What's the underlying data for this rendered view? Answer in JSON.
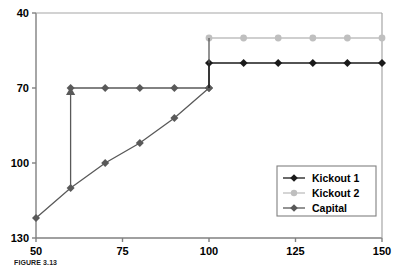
{
  "chart_data": {
    "type": "line",
    "title": "",
    "xlabel": "",
    "ylabel": "",
    "xlim": [
      50,
      150
    ],
    "ylim": [
      40,
      130
    ],
    "xticks": [
      50,
      75,
      100,
      125,
      150
    ],
    "yticks": [
      40,
      70,
      100,
      130
    ],
    "grid": false,
    "legend_position": "bottom-right",
    "series": [
      {
        "name": "Kickout 1",
        "color": "#1a1a1a",
        "marker": "diamond",
        "x": [
          100,
          110,
          120,
          130,
          140,
          150
        ],
        "values": [
          110,
          110,
          110,
          110,
          110,
          110
        ]
      },
      {
        "name": "Kickout 2",
        "color": "#bfbfbf",
        "marker": "circle",
        "x": [
          100,
          110,
          120,
          130,
          140,
          150
        ],
        "values": [
          120,
          120,
          120,
          120,
          120,
          120
        ]
      },
      {
        "name": "Capital",
        "color": "#595959",
        "marker": "diamond",
        "x": [
          50,
          60,
          70,
          80,
          90,
          100
        ],
        "values": [
          48,
          60,
          70,
          78,
          88,
          100
        ]
      },
      {
        "name": "Capital ceiling",
        "color": "#595959",
        "marker": "diamond",
        "x": [
          60,
          70,
          80,
          90,
          100
        ],
        "values": [
          100,
          100,
          100,
          100,
          100
        ]
      }
    ],
    "annotations": [
      {
        "type": "arrow",
        "name": "capital-jump-arrow",
        "x": 60,
        "y_start": 60,
        "y_end": 100,
        "color": "#595959"
      }
    ]
  },
  "axes": {
    "y_tick_labels": [
      "130",
      "100",
      "70",
      "40"
    ],
    "x_tick_labels": [
      "50",
      "75",
      "100",
      "125",
      "150"
    ]
  },
  "legend": {
    "entries": [
      {
        "label": "Kickout 1",
        "color": "#1a1a1a",
        "marker": "diamond"
      },
      {
        "label": "Kickout 2",
        "color": "#bfbfbf",
        "marker": "circle"
      },
      {
        "label": "Capital",
        "color": "#595959",
        "marker": "diamond"
      }
    ]
  },
  "caption": {
    "text": "FIGURE 3.13"
  }
}
